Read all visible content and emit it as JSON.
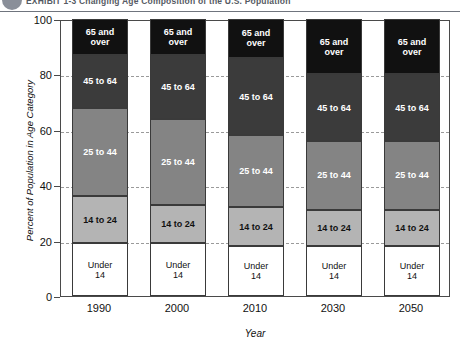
{
  "header": {
    "title": "EXHIBIT 1-3    Changing Age Composition of the U.S. Population",
    "bullet_icon": "bullet-circle-icon"
  },
  "chart_data": {
    "type": "bar",
    "stacked": true,
    "title": "",
    "xlabel": "Year",
    "ylabel": "Percent of Population in Age Category",
    "categories": [
      "1990",
      "2000",
      "2010",
      "2030",
      "2050"
    ],
    "ylim": [
      0,
      100
    ],
    "yticks": [
      0,
      20,
      40,
      60,
      80,
      100
    ],
    "grid": true,
    "legend": "in-bar-labels",
    "series": [
      {
        "name": "Under 14",
        "label": "Under\n14",
        "color": "#ffffff",
        "values": [
          19,
          19,
          18,
          18,
          18
        ]
      },
      {
        "name": "14 to 24",
        "label": "14 to 24",
        "color": "#b4b4b4",
        "values": [
          17,
          14,
          14,
          13,
          13
        ]
      },
      {
        "name": "25 to 44",
        "label": "25 to 44",
        "color": "#848484",
        "values": [
          32,
          31,
          26,
          25,
          25
        ]
      },
      {
        "name": "45 to 64",
        "label": "45 to 64",
        "color": "#3b3b3b",
        "values": [
          19,
          23,
          28,
          24,
          24
        ]
      },
      {
        "name": "65 and over",
        "label": "65 and\nover",
        "color": "#111111",
        "values": [
          13,
          13,
          14,
          20,
          20
        ]
      }
    ]
  },
  "axis": {
    "ytick_labels": [
      "0",
      "20",
      "40",
      "60",
      "80",
      "100"
    ],
    "xtick_labels": [
      "1990",
      "2000",
      "2010",
      "2030",
      "2050"
    ]
  }
}
